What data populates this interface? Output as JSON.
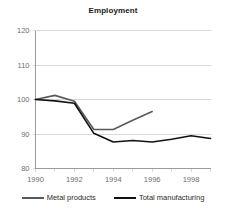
{
  "chart_data": {
    "type": "line",
    "title": "Employment",
    "xlabel": "",
    "ylabel": "",
    "xlim": [
      1990,
      1999
    ],
    "ylim": [
      80,
      120
    ],
    "yticks": [
      80,
      90,
      100,
      110,
      120
    ],
    "xticks": [
      1990,
      1992,
      1994,
      1996,
      1998
    ],
    "xtick_labels": [
      "1990",
      "1992",
      "1994",
      "1996",
      "1998"
    ],
    "ytick_labels": [
      "80",
      "90",
      "100",
      "110",
      "120"
    ],
    "grid": "horizontal",
    "legend_position": "bottom",
    "series": [
      {
        "name": "Metal products",
        "color": "#595959",
        "x": [
          1990,
          1991,
          1992,
          1993,
          1994,
          1995,
          1996
        ],
        "values": [
          100.0,
          101.2,
          99.5,
          91.3,
          91.3,
          94.0,
          96.5
        ]
      },
      {
        "name": "Total manufacturing",
        "color": "#121212",
        "x": [
          1990,
          1991,
          1992,
          1993,
          1994,
          1995,
          1996,
          1997,
          1998,
          1999
        ],
        "values": [
          100.0,
          99.6,
          98.9,
          90.2,
          87.7,
          88.1,
          87.7,
          88.5,
          89.5,
          88.7
        ]
      }
    ]
  },
  "legend": {
    "entries": [
      {
        "label": "Metal products",
        "color": "#595959"
      },
      {
        "label": "Total manufacturing",
        "color": "#121212"
      }
    ]
  },
  "axes": {
    "axis_color": "#9a9a9a",
    "grid_color": "#d9d9d9"
  }
}
